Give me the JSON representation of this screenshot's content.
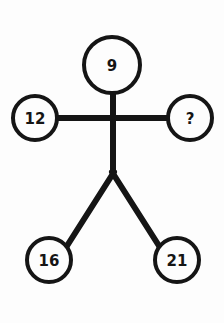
{
  "diagram": {
    "background_color": "#fdfdfd",
    "stroke_color": "#151515",
    "text_color": "#151515",
    "nodes": [
      {
        "id": "head",
        "label": "9",
        "role": "head",
        "cx": 112,
        "cy": 65,
        "r": 28
      },
      {
        "id": "left-hand",
        "label": "12",
        "role": "left-hand",
        "cx": 35,
        "cy": 118,
        "r": 22
      },
      {
        "id": "right-hand",
        "label": "?",
        "role": "right-hand",
        "cx": 190,
        "cy": 118,
        "r": 22
      },
      {
        "id": "left-foot",
        "label": "16",
        "role": "left-foot",
        "cx": 49,
        "cy": 260,
        "r": 22
      },
      {
        "id": "right-foot",
        "label": "21",
        "role": "right-foot",
        "cx": 177,
        "cy": 260,
        "r": 22
      }
    ],
    "edges": [
      {
        "id": "neck",
        "from": "head",
        "to": "torso-top",
        "x1": 113,
        "y1": 93,
        "x2": 113,
        "y2": 118
      },
      {
        "id": "left-arm",
        "from": "left-hand",
        "to": "torso",
        "x1": 57,
        "y1": 118,
        "x2": 113,
        "y2": 118
      },
      {
        "id": "right-arm",
        "from": "right-hand",
        "to": "torso",
        "x1": 168,
        "y1": 118,
        "x2": 113,
        "y2": 118
      },
      {
        "id": "spine",
        "from": "torso",
        "to": "hip",
        "x1": 113,
        "y1": 118,
        "x2": 113,
        "y2": 174
      },
      {
        "id": "left-leg",
        "from": "hip",
        "to": "left-foot",
        "x1": 113,
        "y1": 174,
        "x2": 66,
        "y2": 248
      },
      {
        "id": "right-leg",
        "from": "hip",
        "to": "right-foot",
        "x1": 113,
        "y1": 174,
        "x2": 160,
        "y2": 248
      }
    ],
    "stroke_widths": {
      "circle": 4,
      "limb": 6
    }
  }
}
